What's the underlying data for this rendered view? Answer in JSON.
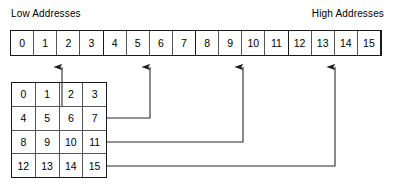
{
  "diagram": {
    "title_low": "Low Addresses",
    "title_high": "High Addresses"
  },
  "address_bar": {
    "name": "linear-memory-address-bar",
    "cells": [
      "0",
      "1",
      "2",
      "3",
      "4",
      "5",
      "6",
      "7",
      "8",
      "9",
      "10",
      "11",
      "12",
      "13",
      "14",
      "15"
    ],
    "group_size": 4,
    "border_color": "#1a1a1a",
    "cell_divider_color": "#555555",
    "background": "#ffffff"
  },
  "matrix": {
    "name": "two-dimensional-array-grid",
    "rows": [
      [
        "0",
        "1",
        "2",
        "3"
      ],
      [
        "4",
        "5",
        "6",
        "7"
      ],
      [
        "8",
        "9",
        "10",
        "11"
      ],
      [
        "12",
        "13",
        "14",
        "15"
      ]
    ],
    "border_color": "#1a1a1a",
    "cell_divider_color": "#555555",
    "background": "#ffffff"
  },
  "connectors": {
    "stroke_color": "#2b2b2b",
    "stroke_width": 1.1,
    "arrow_color": "#1a1a1a",
    "items": [
      {
        "label": "row-0-connector",
        "from_row": "0 1 2 3",
        "arrow_x": 62,
        "target_cell": "2"
      },
      {
        "label": "row-1-connector",
        "from_row": "4 5 6 7",
        "arrow_x": 150,
        "target_cell": "5"
      },
      {
        "label": "row-2-connector",
        "from_row": "8 9 10 11",
        "arrow_x": 243,
        "target_cell": "9"
      },
      {
        "label": "row-3-connector",
        "from_row": "12 13 14 15",
        "arrow_x": 335,
        "target_cell": "13"
      }
    ]
  }
}
